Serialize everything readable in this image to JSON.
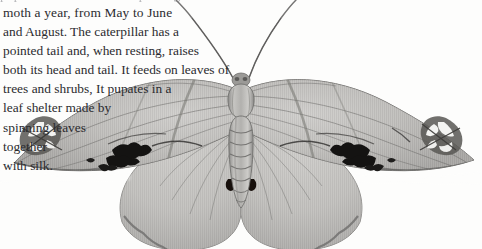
{
  "page": {
    "background_color": "#fdfdfc",
    "ink_color": "#2b2b2f",
    "clipped_top_line": "pupates in a leaf shelter spun together"
  },
  "body_text": {
    "full": "moth a year, from May to June and August. The caterpillar has a pointed tail and, when resting, raises both its head and tail. It feeds on leaves of trees and shrubs, It pupates in a leaf shelter made by spinning leaves together with silk.",
    "lines": [
      "moth a year, from May to June",
      "and August. The caterpillar has a",
      "pointed tail and, when resting, raises",
      "both its head and tail. It feeds on leaves of",
      "trees and shrubs, It pupates in a",
      "leaf shelter made by",
      "spinning leaves",
      "together",
      "with silk."
    ]
  },
  "illustration": {
    "subject": "moth-specimen",
    "style": "engraving-halftone-grayscale",
    "view": "dorsal wings spread",
    "parts": [
      "left-antenna",
      "right-antenna",
      "head",
      "thorax",
      "segmented-abdomen",
      "left-forewing",
      "right-forewing",
      "left-hindwing",
      "right-hindwing"
    ],
    "markings": [
      "white-eyespot-cluster-left-forewing",
      "white-eyespot-cluster-right-forewing",
      "black-zigzag-blotch-left-forewing",
      "black-zigzag-blotch-right-forewing",
      "dark-comma-spot-left-hindwing",
      "dark-comma-spot-right-hindwing",
      "scalloped-fringe-hindwing-margin"
    ],
    "tones": {
      "wing_light": "#d3d2cf",
      "wing_mid": "#a9a8a6",
      "wing_dark": "#6e6d6c",
      "marking_black": "#171716",
      "eyespot_white": "#f6f6f4",
      "antenna": "#7d7c7b"
    }
  }
}
